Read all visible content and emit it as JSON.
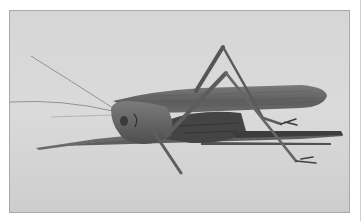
{
  "image": {
    "subject": "katydid",
    "description": "Grayscale side-view photograph of a long-horned grasshopper (katydid) standing on a light flat surface",
    "style": "black-and-white photograph",
    "colors": {
      "page_background": "#ffffff",
      "surface_light": "#dcdcdc",
      "surface_dark": "#c4c4c4",
      "insect_body": "#6e6e6e",
      "insect_dark": "#3a3a3a",
      "shadow": "#4a4a4a",
      "frame_border": "#a8a8a8"
    }
  }
}
